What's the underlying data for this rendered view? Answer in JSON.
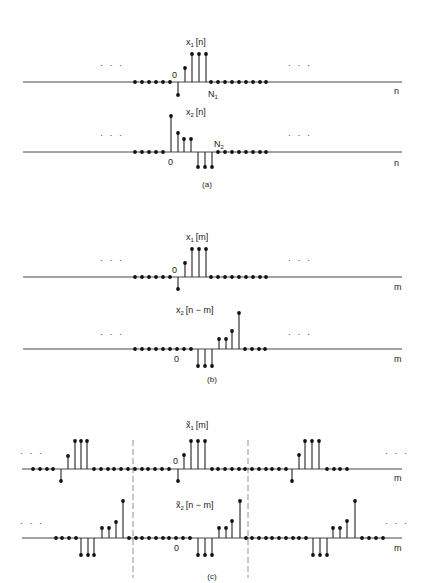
{
  "figure": {
    "captions": {
      "a": "(a)",
      "b": "(b)",
      "c": "(c)"
    },
    "ellipsis": "· · ·"
  },
  "rows": [
    {
      "id": "x1n",
      "panel": "a",
      "axis_y": 82,
      "axis_x0": 23,
      "axis_x1": 402,
      "title": "x",
      "title_sub": "1",
      "title_arg": "[n]",
      "title_x": 186,
      "title_y": 45,
      "axis_var": "n",
      "var_x": 394,
      "var_y": 94,
      "zero_label": {
        "text": "0",
        "x": 172,
        "y": 78
      },
      "end_label": {
        "text": "N",
        "sub": "1",
        "x": 208,
        "y": 97
      },
      "ellipsis_left": {
        "x": 100,
        "y": 68
      },
      "ellipsis_right": {
        "x": 288,
        "y": 68
      },
      "samples": [
        [
          135,
          0
        ],
        [
          142,
          0
        ],
        [
          149,
          0
        ],
        [
          156,
          0
        ],
        [
          163,
          0
        ],
        [
          170,
          0
        ],
        [
          178,
          -13
        ],
        [
          185,
          14
        ],
        [
          192,
          28
        ],
        [
          199,
          28
        ],
        [
          206,
          28
        ],
        [
          211,
          0
        ],
        [
          218,
          0
        ],
        [
          225,
          0
        ],
        [
          232,
          0
        ],
        [
          239,
          0
        ],
        [
          246,
          0
        ],
        [
          253,
          0
        ],
        [
          260,
          0
        ],
        [
          266,
          0
        ]
      ]
    },
    {
      "id": "x2n",
      "panel": "a",
      "axis_y": 152,
      "axis_x0": 23,
      "axis_x1": 402,
      "title": "x",
      "title_sub": "2",
      "title_arg": "[n]",
      "title_x": 186,
      "title_y": 115,
      "axis_var": "n",
      "var_x": 394,
      "var_y": 166,
      "zero_label": {
        "text": "0",
        "x": 168,
        "y": 165
      },
      "end_label": {
        "text": "N",
        "sub": "2",
        "x": 214,
        "y": 147
      },
      "ellipsis_left": {
        "x": 100,
        "y": 138
      },
      "ellipsis_right": {
        "x": 288,
        "y": 138
      },
      "samples": [
        [
          135,
          0
        ],
        [
          142,
          0
        ],
        [
          149,
          0
        ],
        [
          156,
          0
        ],
        [
          163,
          0
        ],
        [
          171,
          36
        ],
        [
          178,
          19
        ],
        [
          184,
          13
        ],
        [
          191,
          13
        ],
        [
          198,
          -15
        ],
        [
          205,
          -15
        ],
        [
          212,
          -15
        ],
        [
          218,
          0
        ],
        [
          225,
          0
        ],
        [
          232,
          0
        ],
        [
          239,
          0
        ],
        [
          246,
          0
        ],
        [
          253,
          0
        ],
        [
          260,
          0
        ],
        [
          266,
          0
        ]
      ]
    },
    {
      "id": "x1m",
      "panel": "b",
      "axis_y": 277,
      "axis_x0": 23,
      "axis_x1": 402,
      "title": "x",
      "title_sub": "1",
      "title_arg": "[m]",
      "title_x": 186,
      "title_y": 240,
      "axis_var": "m",
      "var_x": 394,
      "var_y": 290,
      "zero_label": {
        "text": "0",
        "x": 172,
        "y": 273
      },
      "ellipsis_left": {
        "x": 100,
        "y": 263
      },
      "ellipsis_right": {
        "x": 288,
        "y": 263
      },
      "samples": [
        [
          135,
          0
        ],
        [
          142,
          0
        ],
        [
          149,
          0
        ],
        [
          156,
          0
        ],
        [
          163,
          0
        ],
        [
          170,
          0
        ],
        [
          178,
          -12
        ],
        [
          185,
          14
        ],
        [
          192,
          28
        ],
        [
          199,
          28
        ],
        [
          206,
          28
        ],
        [
          211,
          0
        ],
        [
          218,
          0
        ],
        [
          225,
          0
        ],
        [
          232,
          0
        ],
        [
          239,
          0
        ],
        [
          246,
          0
        ],
        [
          253,
          0
        ],
        [
          260,
          0
        ],
        [
          266,
          0
        ]
      ]
    },
    {
      "id": "x2nm",
      "panel": "b",
      "axis_y": 349,
      "axis_x0": 23,
      "axis_x1": 402,
      "title": "x",
      "title_sub": "2",
      "title_arg": "[n − m]",
      "title_x": 176,
      "title_y": 313,
      "axis_var": "m",
      "var_x": 394,
      "var_y": 362,
      "zero_label": {
        "text": "0",
        "x": 174,
        "y": 362
      },
      "ellipsis_left": {
        "x": 100,
        "y": 337
      },
      "ellipsis_right": {
        "x": 288,
        "y": 337
      },
      "samples": [
        [
          135,
          0
        ],
        [
          142,
          0
        ],
        [
          149,
          0
        ],
        [
          156,
          0
        ],
        [
          163,
          0
        ],
        [
          170,
          0
        ],
        [
          177,
          0
        ],
        [
          184,
          0
        ],
        [
          191,
          0
        ],
        [
          198,
          -17
        ],
        [
          205,
          -17
        ],
        [
          212,
          -17
        ],
        [
          219,
          10
        ],
        [
          226,
          10
        ],
        [
          232,
          18
        ],
        [
          239,
          36
        ],
        [
          245,
          0
        ],
        [
          252,
          0
        ],
        [
          259,
          0
        ],
        [
          265,
          0
        ]
      ]
    },
    {
      "id": "x1m-periodic",
      "panel": "c",
      "axis_y": 469,
      "axis_x0": 22,
      "axis_x1": 402,
      "title": "x̃",
      "title_sub": "1",
      "title_arg": "[m]",
      "title_x": 186,
      "title_y": 428,
      "axis_var": "m",
      "var_x": 394,
      "var_y": 481,
      "zero_label": {
        "text": "0",
        "x": 173,
        "y": 464
      },
      "ellipsis_left": {
        "x": 20,
        "y": 456
      },
      "ellipsis_right": {
        "x": 385,
        "y": 456
      },
      "samples": [
        [
          33,
          0
        ],
        [
          40,
          0
        ],
        [
          47,
          0
        ],
        [
          53,
          0
        ],
        [
          61,
          -12
        ],
        [
          68,
          13
        ],
        [
          75,
          28
        ],
        [
          81,
          28
        ],
        [
          87,
          28
        ],
        [
          94,
          0
        ],
        [
          101,
          0
        ],
        [
          108,
          0
        ],
        [
          114,
          0
        ],
        [
          121,
          0
        ],
        [
          128,
          0
        ],
        [
          135,
          0
        ],
        [
          142,
          0
        ],
        [
          148,
          0
        ],
        [
          155,
          0
        ],
        [
          162,
          0
        ],
        [
          169,
          0
        ],
        [
          178,
          -12
        ],
        [
          184,
          14
        ],
        [
          191,
          28
        ],
        [
          198,
          28
        ],
        [
          205,
          28
        ],
        [
          212,
          0
        ],
        [
          218,
          0
        ],
        [
          225,
          0
        ],
        [
          232,
          0
        ],
        [
          239,
          0
        ],
        [
          245,
          0
        ],
        [
          252,
          0
        ],
        [
          259,
          0
        ],
        [
          266,
          0
        ],
        [
          272,
          0
        ],
        [
          279,
          0
        ],
        [
          286,
          0
        ],
        [
          292,
          -12
        ],
        [
          299,
          14
        ],
        [
          305,
          28
        ],
        [
          312,
          28
        ],
        [
          319,
          28
        ],
        [
          327,
          0
        ],
        [
          334,
          0
        ],
        [
          340,
          0
        ],
        [
          347,
          0
        ]
      ]
    },
    {
      "id": "x2nm-periodic",
      "panel": "c",
      "axis_y": 538,
      "axis_x0": 22,
      "axis_x1": 402,
      "title": "x̃",
      "title_sub": "2",
      "title_arg": "[n − m]",
      "title_x": 176,
      "title_y": 508,
      "axis_var": "m",
      "var_x": 394,
      "var_y": 551,
      "zero_label": {
        "text": "0",
        "x": 174,
        "y": 551
      },
      "ellipsis_left": {
        "x": 20,
        "y": 526
      },
      "ellipsis_right": {
        "x": 385,
        "y": 526
      },
      "samples": [
        [
          56,
          0
        ],
        [
          62,
          0
        ],
        [
          69,
          0
        ],
        [
          76,
          0
        ],
        [
          81,
          -17
        ],
        [
          88,
          -17
        ],
        [
          94,
          -17
        ],
        [
          102,
          10
        ],
        [
          109,
          10
        ],
        [
          116,
          16
        ],
        [
          123,
          37
        ],
        [
          129,
          0
        ],
        [
          136,
          0
        ],
        [
          142,
          0
        ],
        [
          149,
          0
        ],
        [
          156,
          0
        ],
        [
          163,
          0
        ],
        [
          169,
          0
        ],
        [
          176,
          0
        ],
        [
          183,
          0
        ],
        [
          190,
          0
        ],
        [
          198,
          -17
        ],
        [
          205,
          -17
        ],
        [
          212,
          -17
        ],
        [
          219,
          10
        ],
        [
          226,
          10
        ],
        [
          232,
          17
        ],
        [
          240,
          37
        ],
        [
          246,
          0
        ],
        [
          252,
          0
        ],
        [
          259,
          0
        ],
        [
          266,
          0
        ],
        [
          272,
          0
        ],
        [
          279,
          0
        ],
        [
          286,
          0
        ],
        [
          293,
          0
        ],
        [
          299,
          0
        ],
        [
          306,
          0
        ],
        [
          313,
          -17
        ],
        [
          320,
          -17
        ],
        [
          327,
          -17
        ],
        [
          333,
          10
        ],
        [
          340,
          10
        ],
        [
          347,
          17
        ],
        [
          355,
          37
        ],
        [
          362,
          0
        ],
        [
          369,
          0
        ],
        [
          376,
          0
        ],
        [
          383,
          0
        ]
      ]
    }
  ],
  "dashed_dividers": [
    {
      "x": 133,
      "y0": 440,
      "y1": 578
    },
    {
      "x": 248,
      "y0": 440,
      "y1": 578
    }
  ],
  "caption_positions": {
    "a": [
      141,
      187
    ],
    "b": [
      141,
      382
    ],
    "c": [
      141,
      579
    ]
  }
}
